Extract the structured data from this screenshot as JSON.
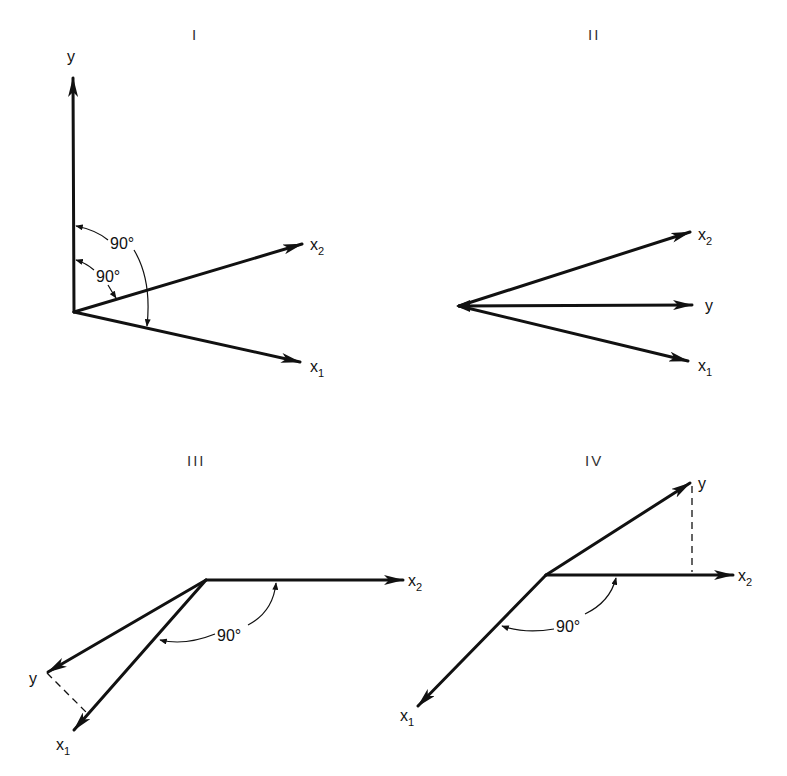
{
  "figure": {
    "panels": [
      {
        "id": "I",
        "title": "I",
        "vectors": [
          {
            "name": "y",
            "label": "y",
            "sub": ""
          },
          {
            "name": "x2",
            "label": "x",
            "sub": "2"
          },
          {
            "name": "x1",
            "label": "x",
            "sub": "1"
          }
        ],
        "angles": [
          {
            "between": "y-x2",
            "label": "90°"
          },
          {
            "between": "y-x1",
            "label": "90°"
          }
        ],
        "description": "y orthogonal to both x1 and x2"
      },
      {
        "id": "II",
        "title": "II",
        "vectors": [
          {
            "name": "x2",
            "label": "x",
            "sub": "2"
          },
          {
            "name": "y",
            "label": "y",
            "sub": ""
          },
          {
            "name": "x1",
            "label": "x",
            "sub": "1"
          }
        ],
        "angles": [],
        "description": "y lies between x1 and x2 in their plane"
      },
      {
        "id": "III",
        "title": "III",
        "vectors": [
          {
            "name": "x2",
            "label": "x",
            "sub": "2"
          },
          {
            "name": "y",
            "label": "y",
            "sub": ""
          },
          {
            "name": "x1",
            "label": "x",
            "sub": "1"
          }
        ],
        "angles": [
          {
            "between": "x1-x2",
            "label": "90°"
          }
        ],
        "projection": "y projected onto x1 (dashed)",
        "description": "x1 orthogonal to x2, y projects onto x1"
      },
      {
        "id": "IV",
        "title": "IV",
        "vectors": [
          {
            "name": "y",
            "label": "y",
            "sub": ""
          },
          {
            "name": "x2",
            "label": "x",
            "sub": "2"
          },
          {
            "name": "x1",
            "label": "x",
            "sub": "1"
          }
        ],
        "angles": [
          {
            "between": "x1-x2",
            "label": "90°"
          }
        ],
        "projection": "y projected onto x2 (dashed)",
        "description": "x1 orthogonal to x2, y projects onto x2"
      }
    ]
  }
}
